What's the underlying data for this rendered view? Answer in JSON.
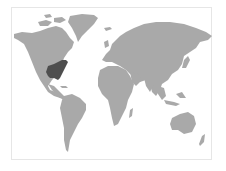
{
  "map": {
    "type": "world-choropleth",
    "land_color": "#a9a9a9",
    "highlight_color": "#4e4e4e",
    "background_color": "#ffffff",
    "border_color": "#e6e6e6",
    "highlighted_regions": [
      "United States (central/eastern)"
    ]
  }
}
